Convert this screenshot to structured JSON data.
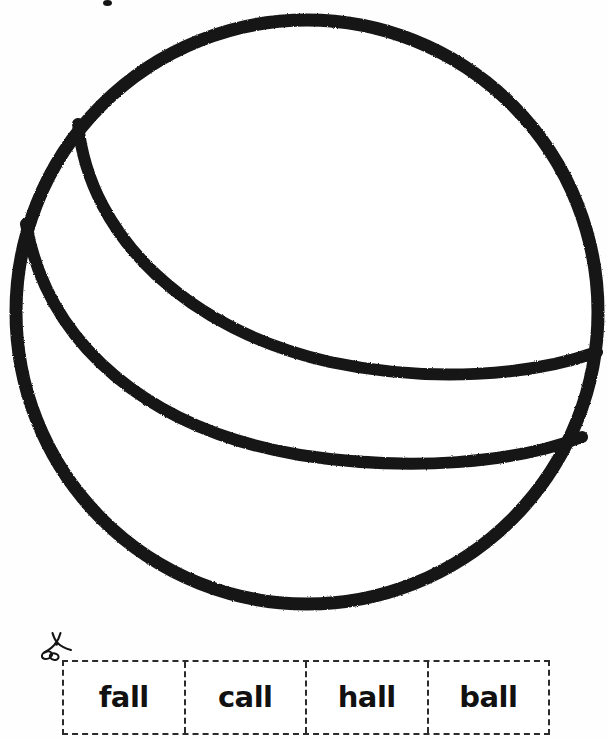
{
  "page": {
    "background_color": "#fefefe",
    "ink_color": "#151515",
    "width": 607,
    "height": 739
  },
  "illustration": {
    "name": "ball-line-drawing",
    "description": "Black outline drawing of a ball with two curved band lines",
    "stroke_color": "#151515",
    "fill_color": "#ffffff",
    "circle": {
      "cx": 307,
      "cy": 312,
      "rx": 295,
      "ry": 294
    },
    "arcs": [
      {
        "name": "upper-band-arc",
        "start": [
          78,
          124
        ],
        "end": [
          597,
          352
        ]
      },
      {
        "name": "lower-band-arc",
        "start": [
          26,
          224
        ],
        "end": [
          582,
          437
        ]
      }
    ]
  },
  "speck": {
    "name": "ink-speck",
    "color": "#151515"
  },
  "cut_strip": {
    "scissors_icon_name": "scissors-icon",
    "border_style": "dashed",
    "border_color": "#2b2b2b",
    "cells": [
      {
        "word": "fall"
      },
      {
        "word": "call"
      },
      {
        "word": "hall"
      },
      {
        "word": "ball"
      }
    ]
  }
}
